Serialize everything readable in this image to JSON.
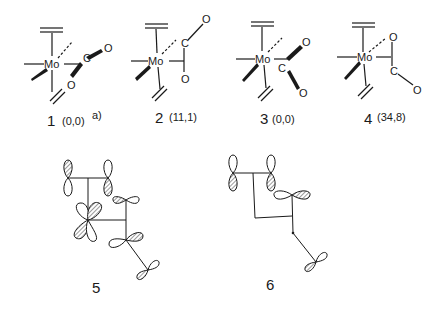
{
  "figure": {
    "type": "chemical structures and orbital diagrams",
    "structures": [
      {
        "number": "1",
        "energy": "(0,0)",
        "footnote": "a)",
        "atoms": {
          "metal": "Mo",
          "carbon": "C",
          "oxygen1": "O",
          "oxygen2": "O"
        }
      },
      {
        "number": "2",
        "energy": "(11,1)",
        "atoms": {
          "metal": "Mo",
          "carbon": "C",
          "oxygen1": "O",
          "oxygen2": "O"
        }
      },
      {
        "number": "3",
        "energy": "(0,0)",
        "atoms": {
          "metal": "Mo",
          "carbon": "C",
          "oxygen1": "O",
          "oxygen2": "O"
        }
      },
      {
        "number": "4",
        "energy": "(34,8)",
        "atoms": {
          "metal": "Mo",
          "carbon": "C",
          "oxygen1": "O",
          "oxygen2": "O"
        }
      }
    ],
    "orbital_diagrams": [
      {
        "number": "5"
      },
      {
        "number": "6"
      }
    ]
  },
  "colors": {
    "ink": "#1a1a1a",
    "background": "#ffffff"
  }
}
